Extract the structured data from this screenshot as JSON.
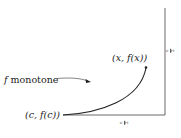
{
  "diagram": {
    "labels": {
      "start_point": "(c, f(c))",
      "end_point": "(x, f(x))",
      "annotation_prefix": "f",
      "annotation_text": " monotone"
    },
    "tick_labels": {
      "vertical_axis": {
        "numerator": "ε",
        "denominator": "2"
      },
      "horizontal_axis": {
        "numerator": "ε",
        "denominator": "2"
      }
    },
    "colors": {
      "stroke": "#222222",
      "background": "#ffffff"
    }
  }
}
